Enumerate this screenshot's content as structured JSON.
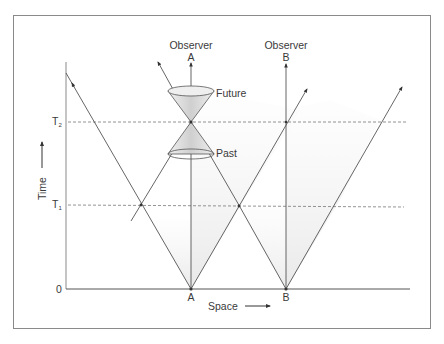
{
  "diagram": {
    "axes": {
      "time_label": "Time",
      "space_label": "Space",
      "origin_label": "0",
      "time_ticks": [
        {
          "label": "T",
          "sub": "1"
        },
        {
          "label": "T",
          "sub": "2"
        }
      ]
    },
    "observers": [
      {
        "label": "Observer",
        "id": "A",
        "base_label": "A"
      },
      {
        "label": "Observer",
        "id": "B",
        "base_label": "B"
      }
    ],
    "cone_labels": {
      "future": "Future",
      "past": "Past"
    },
    "colors": {
      "line": "#555555",
      "dashed": "#777777",
      "shade": "#d9d9d9",
      "frame": "#888888",
      "text": "#3a3a3a"
    }
  }
}
